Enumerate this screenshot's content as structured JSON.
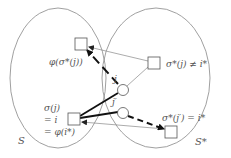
{
  "diagram": {
    "sets": [
      {
        "id": "S",
        "label": "S"
      },
      {
        "id": "S_star",
        "label": "S*"
      }
    ],
    "nodes": {
      "phi_sigma_star_j": {
        "label": "φ(σ*(j))",
        "shape": "square"
      },
      "sigma_star_j": {
        "label": "σ*(j) ≠ i*",
        "shape": "square"
      },
      "j": {
        "label": "j",
        "shape": "circle"
      },
      "j_prime": {
        "label": "j′",
        "shape": "circle"
      },
      "i": {
        "label_lines": [
          "σ(j)",
          "= i",
          "= φ(i*)"
        ],
        "shape": "square"
      },
      "sigma_star_j_prime": {
        "label": "σ*(j′) = i*",
        "shape": "square"
      }
    },
    "edges": [
      {
        "from": "sigma_star_j",
        "to": "phi_sigma_star_j",
        "style": "thin-arrow"
      },
      {
        "from": "j",
        "to": "phi_sigma_star_j",
        "style": "thick-dashed-arrow"
      },
      {
        "from": "j",
        "to": "sigma_star_j",
        "style": "thin"
      },
      {
        "from": "j",
        "to": "i",
        "style": "thick"
      },
      {
        "from": "j_prime",
        "to": "i",
        "style": "thick"
      },
      {
        "from": "sigma_star_j_prime",
        "to": "i",
        "style": "thin-arrow"
      },
      {
        "from": "j_prime",
        "to": "sigma_star_j_prime",
        "style": "thick-dashed-arrow"
      }
    ],
    "colors": {
      "thin_line": "#888888",
      "thick_line": "#111111",
      "ellipse": "#888888",
      "text": "#555555"
    }
  }
}
